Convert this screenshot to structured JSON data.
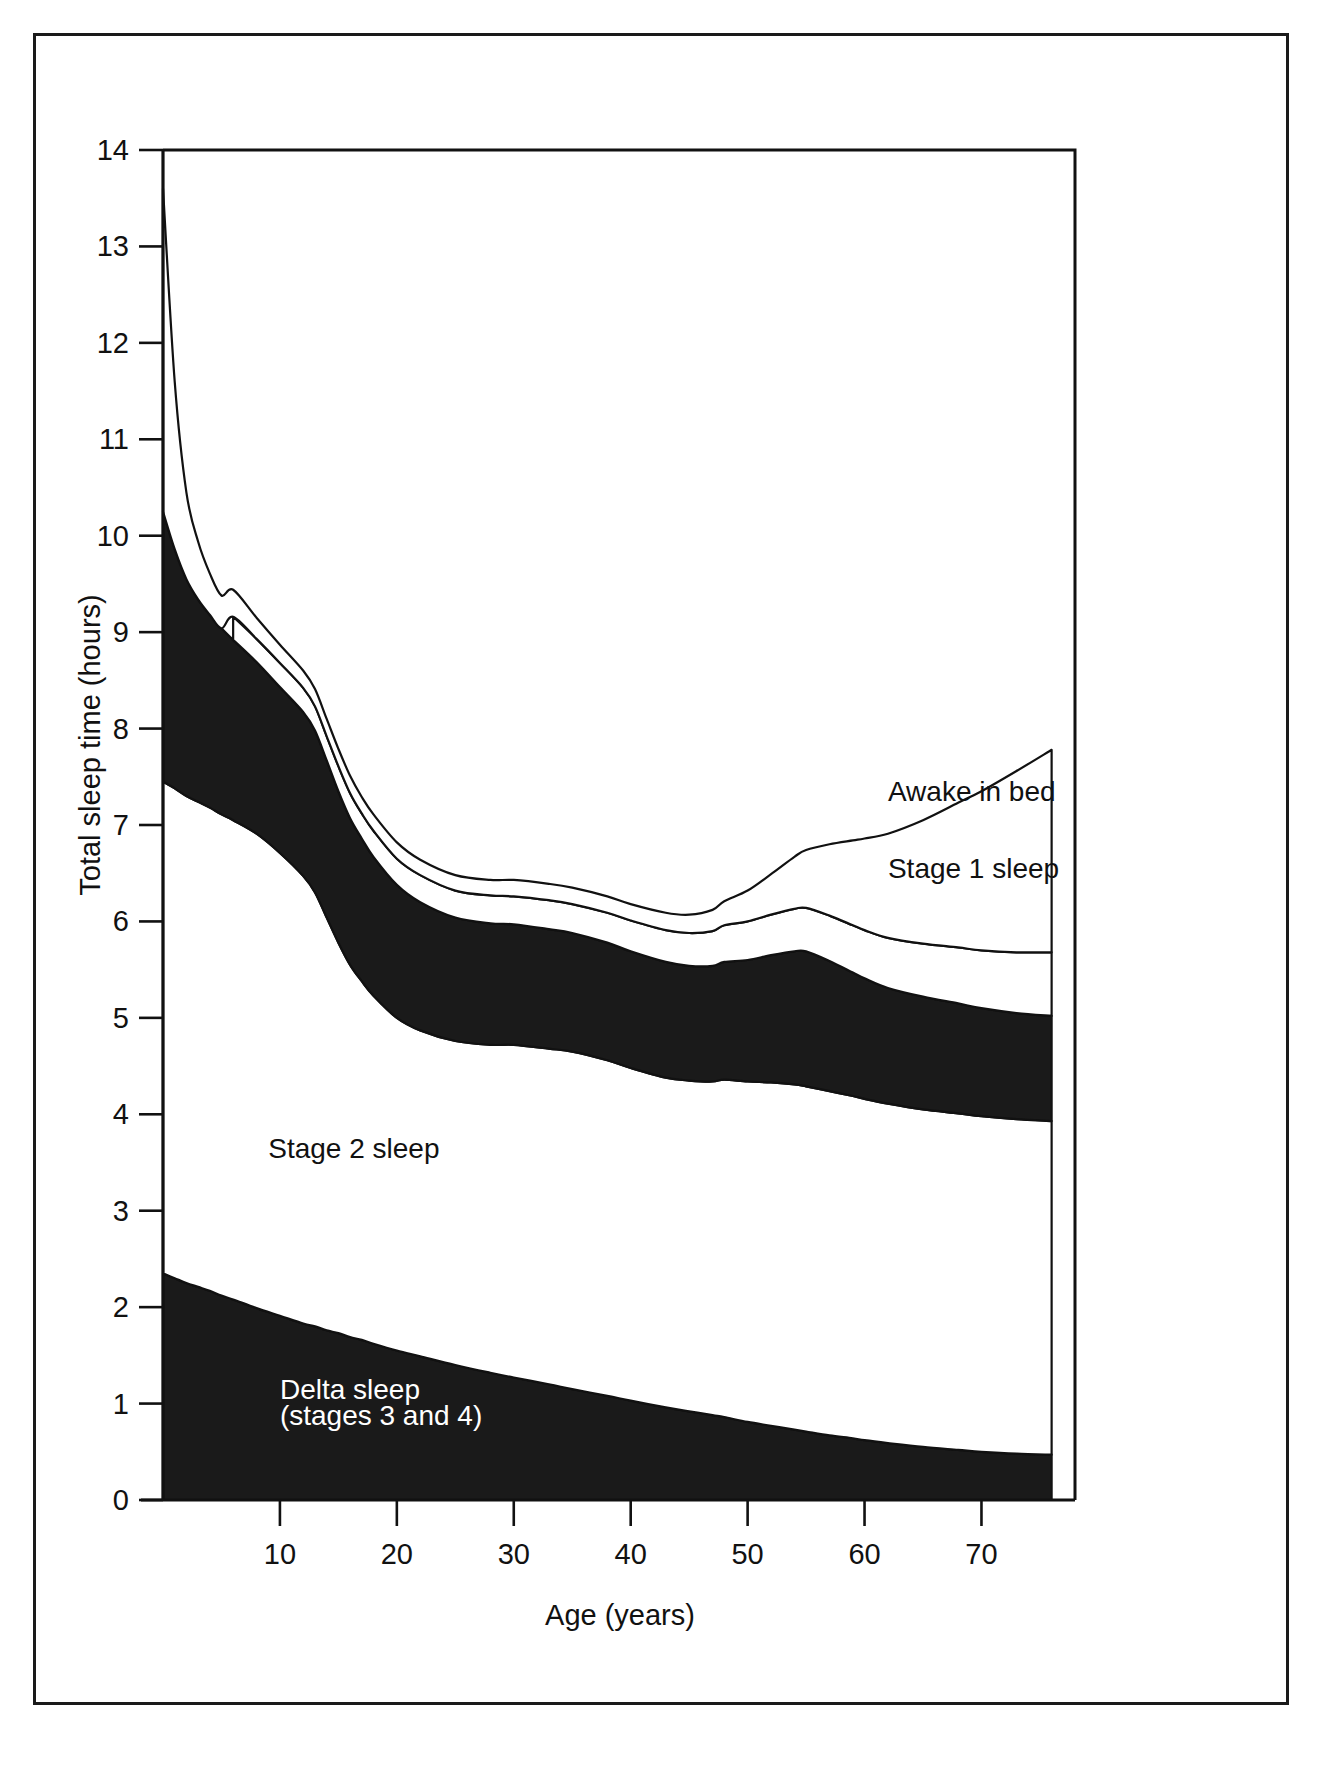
{
  "figure": {
    "border_color": "#1a1a1a",
    "background": "#ffffff"
  },
  "chart_data": {
    "type": "area",
    "stacked": true,
    "title": "",
    "subtitle": "",
    "xlabel": "Age (years)",
    "ylabel": "Total sleep time (hours)",
    "xlim": [
      0,
      78
    ],
    "ylim": [
      0,
      14
    ],
    "grid": false,
    "legend_position": "inline-annotations",
    "xticks": [
      10,
      20,
      30,
      40,
      50,
      60,
      70
    ],
    "xtick_labels": [
      "10",
      "20",
      "30",
      "40",
      "50",
      "60",
      "70"
    ],
    "x_origin_label": "0",
    "yticks": [
      0,
      1,
      2,
      3,
      4,
      5,
      6,
      7,
      8,
      9,
      10,
      11,
      12,
      13,
      14
    ],
    "ytick_labels": [
      "0",
      "1",
      "2",
      "3",
      "4",
      "5",
      "6",
      "7",
      "8",
      "9",
      "10",
      "11",
      "12",
      "13",
      "14"
    ],
    "x": [
      0,
      1,
      2,
      3,
      4,
      5,
      6,
      8,
      10,
      12,
      13,
      14,
      15,
      16,
      17,
      18,
      20,
      22,
      25,
      28,
      30,
      33,
      35,
      38,
      40,
      43,
      45,
      47,
      48,
      50,
      52,
      54,
      55,
      57,
      59,
      60,
      62,
      65,
      68,
      70,
      73,
      76
    ],
    "series": [
      {
        "name": "Delta sleep (stages 3 and 4)",
        "fill": "#1a1a1a",
        "label_color": "#ffffff",
        "label_x": 10,
        "label_y": 1.0,
        "values": [
          2.35,
          2.3,
          2.25,
          2.21,
          2.17,
          2.12,
          2.08,
          1.99,
          1.91,
          1.83,
          1.8,
          1.76,
          1.73,
          1.69,
          1.66,
          1.62,
          1.55,
          1.49,
          1.4,
          1.32,
          1.27,
          1.2,
          1.15,
          1.08,
          1.03,
          0.96,
          0.92,
          0.88,
          0.86,
          0.81,
          0.77,
          0.73,
          0.71,
          0.67,
          0.64,
          0.62,
          0.59,
          0.55,
          0.52,
          0.5,
          0.48,
          0.47
        ]
      },
      {
        "name": "Stage 2 sleep",
        "fill": "#ffffff",
        "label_color": "#111111",
        "label_x": 9,
        "label_y": 3.55,
        "values": [
          5.1,
          5.08,
          5.05,
          5.03,
          5.01,
          4.99,
          4.97,
          4.92,
          4.8,
          4.64,
          4.5,
          4.28,
          4.05,
          3.86,
          3.72,
          3.61,
          3.45,
          3.38,
          3.36,
          3.4,
          3.45,
          3.48,
          3.5,
          3.48,
          3.45,
          3.42,
          3.43,
          3.46,
          3.5,
          3.53,
          3.56,
          3.58,
          3.58,
          3.57,
          3.55,
          3.54,
          3.52,
          3.5,
          3.49,
          3.48,
          3.47,
          3.46
        ]
      },
      {
        "name": "REM sleep",
        "fill": "#1a1a1a",
        "label_color": "#ffffff",
        "label_x": 62,
        "label_y": 5.35,
        "values": [
          2.8,
          2.48,
          2.25,
          2.1,
          2.0,
          1.93,
          1.87,
          1.78,
          1.72,
          1.7,
          1.68,
          1.63,
          1.57,
          1.52,
          1.48,
          1.44,
          1.38,
          1.33,
          1.28,
          1.26,
          1.25,
          1.24,
          1.23,
          1.22,
          1.21,
          1.2,
          1.19,
          1.2,
          1.22,
          1.26,
          1.32,
          1.38,
          1.4,
          1.35,
          1.28,
          1.25,
          1.2,
          1.17,
          1.14,
          1.12,
          1.1,
          1.09
        ]
      },
      {
        "name": "Stage 1 sleep",
        "fill": "#ffffff",
        "label_color": "#111111",
        "label_x": 62,
        "label_y": 6.45,
        "values": [
          0.0,
          0.0,
          0.0,
          0.0,
          0.0,
          0.0,
          0.24,
          0.24,
          0.25,
          0.25,
          0.25,
          0.25,
          0.26,
          0.26,
          0.26,
          0.27,
          0.27,
          0.28,
          0.28,
          0.29,
          0.29,
          0.3,
          0.3,
          0.31,
          0.32,
          0.33,
          0.34,
          0.36,
          0.38,
          0.4,
          0.42,
          0.44,
          0.45,
          0.47,
          0.49,
          0.5,
          0.52,
          0.55,
          0.58,
          0.6,
          0.63,
          0.66
        ]
      },
      {
        "name": "Awake in bed",
        "fill": "#ffffff",
        "label_color": "#111111",
        "label_x": 62,
        "label_y": 7.25,
        "values": [
          3.35,
          1.74,
          0.9,
          0.6,
          0.43,
          0.34,
          0.28,
          0.22,
          0.19,
          0.18,
          0.18,
          0.18,
          0.18,
          0.18,
          0.17,
          0.17,
          0.17,
          0.16,
          0.16,
          0.16,
          0.17,
          0.17,
          0.17,
          0.17,
          0.17,
          0.18,
          0.19,
          0.22,
          0.25,
          0.32,
          0.42,
          0.54,
          0.6,
          0.74,
          0.88,
          0.95,
          1.08,
          1.28,
          1.5,
          1.65,
          1.88,
          2.1
        ]
      }
    ],
    "annotations": [
      {
        "text": "Awake in bed",
        "x": 62,
        "y": 7.25,
        "color": "#111111"
      },
      {
        "text": "Stage 1 sleep",
        "x": 62,
        "y": 6.45,
        "color": "#111111"
      },
      {
        "text": "REM sleep",
        "x": 62,
        "y": 5.35,
        "color": "#ffffff"
      },
      {
        "text": "Stage 2 sleep",
        "x": 9,
        "y": 3.55,
        "color": "#111111"
      },
      {
        "text": "Delta sleep",
        "x": 10,
        "y": 1.05,
        "color": "#ffffff"
      },
      {
        "text": "(stages 3 and 4)",
        "x": 10,
        "y": 0.78,
        "color": "#ffffff"
      }
    ]
  },
  "labels": {
    "y_axis_title": "Total sleep time (hours)",
    "x_axis_title": "Age (years)",
    "awake_in_bed": "Awake in bed",
    "stage_1_sleep": "Stage 1 sleep",
    "rem_sleep": "REM sleep",
    "stage_2_sleep": "Stage 2 sleep",
    "delta_sleep_line1": "Delta sleep",
    "delta_sleep_line2": "(stages 3 and 4)",
    "ytick_0": "0",
    "ytick_1": "1",
    "ytick_2": "2",
    "ytick_3": "3",
    "ytick_4": "4",
    "ytick_5": "5",
    "ytick_6": "6",
    "ytick_7": "7",
    "ytick_8": "8",
    "ytick_9": "9",
    "ytick_10": "10",
    "ytick_11": "11",
    "ytick_12": "12",
    "ytick_13": "13",
    "ytick_14": "14",
    "xtick_10": "10",
    "xtick_20": "20",
    "xtick_30": "30",
    "xtick_40": "40",
    "xtick_50": "50",
    "xtick_60": "60",
    "xtick_70": "70"
  }
}
